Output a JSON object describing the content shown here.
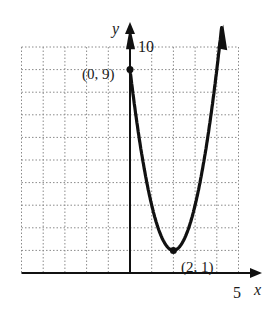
{
  "chart_data": {
    "type": "line",
    "title": "",
    "xlabel": "x",
    "ylabel": "y",
    "xlim": [
      -5,
      5
    ],
    "ylim": [
      0,
      10
    ],
    "grid": true,
    "grid_style": "dotted",
    "tick_labels": {
      "x": [
        "5"
      ],
      "y": [
        "10"
      ]
    },
    "series": [
      {
        "name": "parabola",
        "equation": "y = 2(x - 2)^2 + 1",
        "x": [
          0,
          0.5,
          1,
          1.5,
          2,
          2.5,
          3,
          3.5,
          4.2
        ],
        "y": [
          9,
          5.5,
          3,
          1.5,
          1,
          1.5,
          3,
          5.5,
          10.68
        ]
      }
    ],
    "annotations": [
      {
        "label": "(0, 9)",
        "x": 0,
        "y": 9
      },
      {
        "label": "(2, 1)",
        "x": 2,
        "y": 1
      }
    ],
    "legend": null
  },
  "labels": {
    "x_axis": "x",
    "y_axis": "y",
    "x_tick": "5",
    "y_tick": "10",
    "point_a": "(0, 9)",
    "point_b": "(2, 1)"
  },
  "colors": {
    "curve": "#111111",
    "axis": "#111111",
    "grid": "#8a8a8a"
  }
}
